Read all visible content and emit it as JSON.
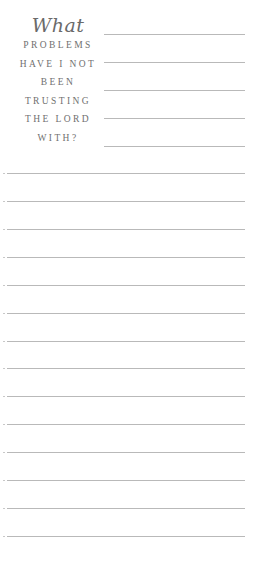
{
  "prompt": {
    "script_word": "What",
    "caps_lines": [
      "PROBLEMS",
      "HAVE I NOT",
      "BEEN",
      "TRUSTING",
      "THE LORD",
      "WITH?"
    ]
  },
  "short_lines_y": [
    34,
    62,
    90,
    118,
    146
  ],
  "full_lines_y": [
    173,
    201,
    229,
    257,
    285,
    313,
    341,
    368,
    396,
    424,
    452,
    480,
    508,
    536
  ],
  "colors": {
    "text": "#707070",
    "rule": "#b9b9b9",
    "background": "#ffffff"
  }
}
